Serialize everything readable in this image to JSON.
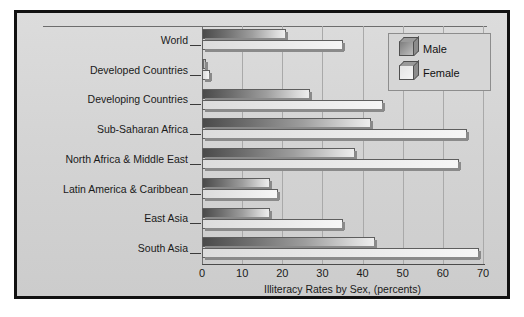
{
  "chart_data": {
    "type": "bar",
    "orientation": "horizontal",
    "title": "",
    "xlabel": "Illiteracy Rates by Sex, (percents)",
    "ylabel": "",
    "xlim": [
      0,
      70
    ],
    "xticks": [
      0,
      10,
      20,
      30,
      40,
      50,
      60,
      70
    ],
    "grid": true,
    "legend_position": "top-right",
    "categories": [
      "World",
      "Developed Countries",
      "Developing Countries",
      "Sub-Saharan Africa",
      "North Africa & Middle East",
      "Latin America & Caribbean",
      "East Asia",
      "South Asia"
    ],
    "series": [
      {
        "name": "Male",
        "values": [
          21,
          1,
          27,
          42,
          38,
          17,
          17,
          43
        ]
      },
      {
        "name": "Female",
        "values": [
          35,
          2,
          45,
          66,
          64,
          19,
          35,
          69
        ]
      }
    ]
  },
  "legend": {
    "items": [
      {
        "label": "Male",
        "swatch": "cube-dark-icon"
      },
      {
        "label": "Female",
        "swatch": "cube-light-icon"
      }
    ]
  },
  "colors": {
    "frame": "#111111",
    "plate": "#d4d4d4",
    "gridline": "#a9a9a9",
    "axis": "#4a4a4a",
    "male_bar_dark": "#4a4a4a",
    "male_bar_light": "#eeeeee",
    "female_bar": "#ececec",
    "bar_outline": "#5e5e5e",
    "bar_shadow": "#8a8a8a",
    "text": "#1a1a1a"
  }
}
